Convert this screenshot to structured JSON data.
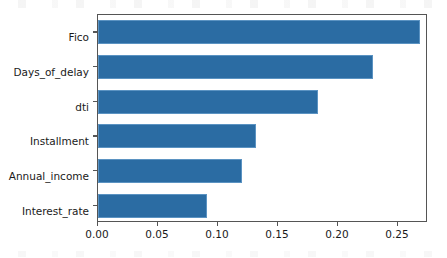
{
  "figure": {
    "background_color": "#ffffff",
    "axes_edge_color": "#555555",
    "bar_color": "#2b6ca3",
    "bar_edge_color": "#5b93c2",
    "tick_label_color": "#1a1a1a"
  },
  "chart_data": {
    "type": "bar",
    "orientation": "horizontal",
    "title": "",
    "xlabel": "",
    "ylabel": "",
    "categories": [
      "Fico",
      "Days_of_delay",
      "dti",
      "Installment",
      "Annual_income",
      "Interest_rate"
    ],
    "values": [
      0.268,
      0.229,
      0.183,
      0.132,
      0.12,
      0.091
    ],
    "xlim": [
      0.0,
      0.275
    ],
    "xticks": [
      0.0,
      0.05,
      0.1,
      0.15,
      0.2,
      0.25
    ],
    "xtick_labels": [
      "0.00",
      "0.05",
      "0.10",
      "0.15",
      "0.20",
      "0.25"
    ],
    "grid": false,
    "legend": null,
    "series": [
      {
        "name": "importance",
        "values": [
          0.268,
          0.229,
          0.183,
          0.132,
          0.12,
          0.091
        ]
      }
    ]
  }
}
